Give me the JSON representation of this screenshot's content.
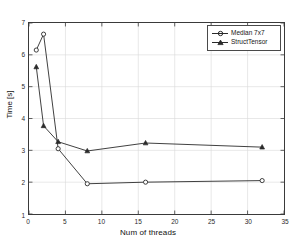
{
  "chart_data": {
    "type": "line",
    "title": "",
    "xlabel": "Num of threads",
    "ylabel": "Time [s]",
    "xlim": [
      0,
      35
    ],
    "ylim": [
      1,
      7
    ],
    "xticks": [
      0,
      5,
      10,
      15,
      20,
      25,
      30,
      35
    ],
    "yticks": [
      1,
      2,
      3,
      4,
      5,
      6,
      7
    ],
    "grid": true,
    "legend_position": "top-right",
    "x": [
      1,
      2,
      4,
      8,
      16,
      32
    ],
    "series": [
      {
        "name": "Median 7x7",
        "marker": "circle",
        "color": "#2a2a2a",
        "values": [
          6.15,
          6.65,
          3.05,
          1.95,
          2.0,
          2.05
        ]
      },
      {
        "name": "StructTensor",
        "marker": "triangle",
        "color": "#2a2a2a",
        "values": [
          5.62,
          3.77,
          3.27,
          2.98,
          3.23,
          3.1
        ]
      }
    ]
  },
  "axes": {
    "xlabel": "Num of threads",
    "ylabel": "Time [s]",
    "xtick_labels": [
      "0",
      "5",
      "10",
      "15",
      "20",
      "25",
      "30",
      "35"
    ],
    "ytick_labels": [
      "1",
      "2",
      "3",
      "4",
      "5",
      "6",
      "7"
    ]
  },
  "legend": {
    "entries": [
      {
        "label": "Median 7x7",
        "marker": "circle-marker-icon"
      },
      {
        "label": "StructTensor",
        "marker": "triangle-marker-icon"
      }
    ]
  },
  "colors": {
    "line": "#2a2a2a",
    "grid": "#d8d8d8",
    "frame": "#3a3a3a",
    "background": "#ffffff",
    "text": "#111111"
  }
}
